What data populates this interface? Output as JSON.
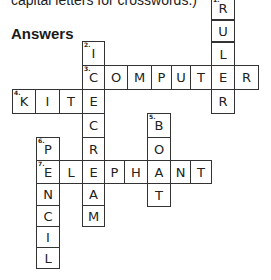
{
  "intro_text": "capital letters for crosswords.)",
  "heading": "Answers",
  "words": [
    {
      "number": "1",
      "answer": "RULER",
      "direction": "down"
    },
    {
      "number": "2",
      "answer": "ICECREAM",
      "direction": "down"
    },
    {
      "number": "3",
      "answer": "COMPUTER",
      "direction": "across"
    },
    {
      "number": "4",
      "answer": "KITE",
      "direction": "across"
    },
    {
      "number": "5",
      "answer": "BOAT",
      "direction": "down"
    },
    {
      "number": "6",
      "answer": "PENCIL",
      "direction": "down"
    },
    {
      "number": "7",
      "answer": "ELEPHANT",
      "direction": "across"
    }
  ],
  "cells": [
    {
      "x": 211,
      "y": -4,
      "w": 24,
      "h": 24,
      "letter": "R",
      "num": "1"
    },
    {
      "x": 211,
      "y": 20,
      "w": 24,
      "h": 22,
      "letter": "U",
      "num": ""
    },
    {
      "x": 211,
      "y": 42,
      "w": 24,
      "h": 24,
      "letter": "L",
      "num": ""
    },
    {
      "x": 82,
      "y": 41,
      "w": 23,
      "h": 25,
      "letter": "I",
      "num": "2"
    },
    {
      "x": 82,
      "y": 65,
      "w": 23,
      "h": 25,
      "letter": "C",
      "num": "3"
    },
    {
      "x": 104,
      "y": 65,
      "w": 24,
      "h": 25,
      "letter": "O",
      "num": ""
    },
    {
      "x": 127,
      "y": 65,
      "w": 25,
      "h": 25,
      "letter": "M",
      "num": ""
    },
    {
      "x": 151,
      "y": 65,
      "w": 21,
      "h": 25,
      "letter": "P",
      "num": ""
    },
    {
      "x": 171,
      "y": 65,
      "w": 20,
      "h": 25,
      "letter": "U",
      "num": ""
    },
    {
      "x": 190,
      "y": 65,
      "w": 22,
      "h": 25,
      "letter": "T",
      "num": ""
    },
    {
      "x": 211,
      "y": 65,
      "w": 24,
      "h": 25,
      "letter": "E",
      "num": ""
    },
    {
      "x": 234,
      "y": 65,
      "w": 25,
      "h": 25,
      "letter": "R",
      "num": ""
    },
    {
      "x": 12,
      "y": 89,
      "w": 24,
      "h": 25,
      "letter": "K",
      "num": "4"
    },
    {
      "x": 35,
      "y": 89,
      "w": 25,
      "h": 25,
      "letter": "I",
      "num": ""
    },
    {
      "x": 59,
      "y": 89,
      "w": 24,
      "h": 25,
      "letter": "T",
      "num": ""
    },
    {
      "x": 82,
      "y": 89,
      "w": 23,
      "h": 25,
      "letter": "E",
      "num": ""
    },
    {
      "x": 211,
      "y": 89,
      "w": 24,
      "h": 25,
      "letter": "R",
      "num": ""
    },
    {
      "x": 82,
      "y": 113,
      "w": 23,
      "h": 25,
      "letter": "C",
      "num": ""
    },
    {
      "x": 82,
      "y": 137,
      "w": 23,
      "h": 24,
      "letter": "R",
      "num": ""
    },
    {
      "x": 147,
      "y": 113,
      "w": 24,
      "h": 25,
      "letter": "B",
      "num": "5"
    },
    {
      "x": 147,
      "y": 137,
      "w": 24,
      "h": 24,
      "letter": "O",
      "num": ""
    },
    {
      "x": 36,
      "y": 137,
      "w": 24,
      "h": 24,
      "letter": "P",
      "num": "6"
    },
    {
      "x": 36,
      "y": 160,
      "w": 24,
      "h": 24,
      "letter": "E",
      "num": "7"
    },
    {
      "x": 59,
      "y": 160,
      "w": 24,
      "h": 24,
      "letter": "L",
      "num": ""
    },
    {
      "x": 82,
      "y": 160,
      "w": 23,
      "h": 24,
      "letter": "E",
      "num": ""
    },
    {
      "x": 104,
      "y": 160,
      "w": 21,
      "h": 24,
      "letter": "P",
      "num": ""
    },
    {
      "x": 124,
      "y": 160,
      "w": 24,
      "h": 24,
      "letter": "H",
      "num": ""
    },
    {
      "x": 147,
      "y": 160,
      "w": 24,
      "h": 24,
      "letter": "A",
      "num": ""
    },
    {
      "x": 170,
      "y": 160,
      "w": 21,
      "h": 24,
      "letter": "N",
      "num": ""
    },
    {
      "x": 190,
      "y": 160,
      "w": 22,
      "h": 24,
      "letter": "T",
      "num": ""
    },
    {
      "x": 36,
      "y": 183,
      "w": 24,
      "h": 23,
      "letter": "N",
      "num": ""
    },
    {
      "x": 82,
      "y": 183,
      "w": 23,
      "h": 23,
      "letter": "A",
      "num": ""
    },
    {
      "x": 147,
      "y": 183,
      "w": 24,
      "h": 24,
      "letter": "T",
      "num": ""
    },
    {
      "x": 36,
      "y": 205,
      "w": 24,
      "h": 22,
      "letter": "C",
      "num": ""
    },
    {
      "x": 82,
      "y": 205,
      "w": 23,
      "h": 22,
      "letter": "M",
      "num": ""
    },
    {
      "x": 36,
      "y": 226,
      "w": 24,
      "h": 22,
      "letter": "I",
      "num": ""
    },
    {
      "x": 36,
      "y": 247,
      "w": 24,
      "h": 22,
      "letter": "L",
      "num": ""
    }
  ]
}
